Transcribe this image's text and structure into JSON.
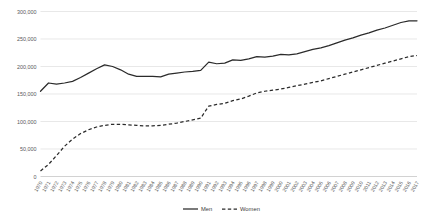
{
  "chart_data": {
    "type": "line",
    "title": "",
    "xlabel": "",
    "ylabel": "",
    "ylim": [
      0,
      300000
    ],
    "grid": true,
    "legend_position": "bottom",
    "categories": [
      "1970",
      "1971",
      "1972",
      "1973",
      "1974",
      "1975",
      "1976",
      "1977",
      "1978",
      "1979",
      "1980",
      "1981",
      "1982",
      "1983",
      "1984",
      "1985",
      "1986",
      "1987",
      "1988",
      "1989",
      "1990",
      "1991",
      "1992",
      "1993",
      "1994",
      "1995",
      "1996",
      "1997",
      "1998",
      "1999",
      "2000",
      "2001",
      "2002",
      "2003",
      "2004",
      "2005",
      "2006",
      "2007",
      "2008",
      "2009",
      "2010",
      "2011",
      "2012",
      "2013",
      "2014",
      "2015",
      "2016",
      "2017"
    ],
    "ytick_labels": [
      "0",
      "50,000",
      "100,000",
      "150,000",
      "200,000",
      "250,000",
      "300,000"
    ],
    "ytick_values": [
      0,
      50000,
      100000,
      150000,
      200000,
      250000,
      300000
    ],
    "series": [
      {
        "name": "Men",
        "style": "solid",
        "color": "#2b2b2b",
        "values": [
          155000,
          170000,
          168000,
          170000,
          173000,
          180000,
          188000,
          196000,
          203000,
          200000,
          194000,
          186000,
          182000,
          182000,
          182000,
          181000,
          186000,
          188000,
          190000,
          191000,
          193000,
          208000,
          205000,
          206000,
          212000,
          211000,
          214000,
          218000,
          217000,
          219000,
          222000,
          221000,
          223000,
          227000,
          231000,
          234000,
          238000,
          243000,
          248000,
          252000,
          257000,
          261000,
          266000,
          270000,
          275000,
          280000,
          283000,
          283000
        ]
      },
      {
        "name": "Women",
        "style": "dashed",
        "color": "#2b2b2b",
        "values": [
          10000,
          22000,
          38000,
          55000,
          68000,
          78000,
          85000,
          90000,
          93000,
          95000,
          95000,
          94000,
          93000,
          92000,
          92000,
          93000,
          95000,
          97000,
          100000,
          103000,
          106000,
          128000,
          131000,
          133000,
          138000,
          141000,
          146000,
          152000,
          155000,
          157000,
          159000,
          162000,
          165000,
          168000,
          171000,
          174000,
          178000,
          182000,
          186000,
          190000,
          194000,
          198000,
          202000,
          206000,
          210000,
          214000,
          218000,
          220000
        ]
      }
    ]
  },
  "legend": {
    "items": [
      {
        "label": "Men"
      },
      {
        "label": "Women"
      }
    ]
  }
}
